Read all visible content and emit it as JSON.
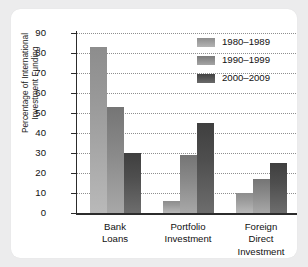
{
  "chart_data": {
    "type": "bar",
    "title": "",
    "xlabel": "",
    "ylabel": "Percentage of International\nInvestment Funding",
    "categories": [
      "Bank\nLoans",
      "Portfolio\nInvestment",
      "Foreign\nDirect\nInvestment"
    ],
    "series": [
      {
        "name": "1980–1989",
        "color": "#9a9a9a",
        "values": [
          83,
          6,
          10
        ]
      },
      {
        "name": "1990–1999",
        "color": "#8a8a8a",
        "values": [
          53,
          29,
          17
        ]
      },
      {
        "name": "2000–2009",
        "color": "#4e4e4e",
        "values": [
          30,
          45,
          25
        ]
      }
    ],
    "ylim": [
      0,
      90
    ],
    "ytick_labels": [
      "90",
      "80",
      "70",
      "60",
      "50",
      "40",
      "30",
      "20",
      "10",
      "0"
    ],
    "ytick_values": [
      90,
      80,
      70,
      60,
      50,
      40,
      30,
      20,
      10,
      0
    ],
    "grid": true,
    "grid_axis": "y",
    "grid_style": "dotted",
    "legend_position": "top-right"
  },
  "colors": {
    "page_background": "#ececed",
    "card_background": "#ffffff",
    "axis": "#2c2c2c",
    "gridline": "#8f8f8f",
    "text": "#111111"
  }
}
